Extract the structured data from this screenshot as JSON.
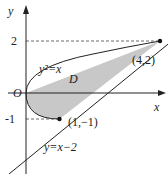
{
  "diagram": {
    "type": "region-between-curves",
    "axes": {
      "x_label": "x",
      "y_label": "y",
      "origin_label": "O"
    },
    "ticks": {
      "y_2": "2",
      "y_neg1": "-1"
    },
    "curves": {
      "parabola_label": "y²=x",
      "line_label": "y=x−2"
    },
    "region_label": "D",
    "points": {
      "upper": "(4,2)",
      "lower": "(1,−1)"
    },
    "colors": {
      "fill": "#c8c8c8",
      "stroke": "#222222",
      "dash": "#444444"
    }
  }
}
